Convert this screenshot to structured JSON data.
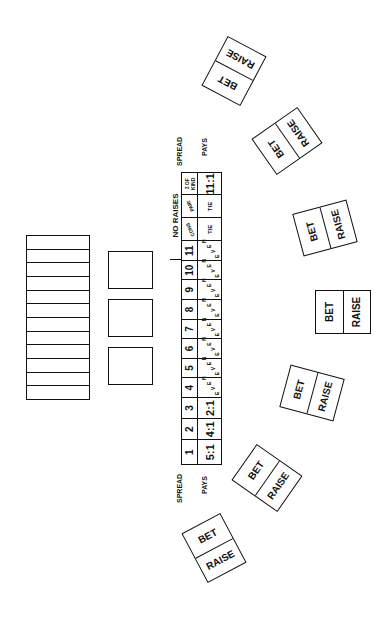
{
  "rack": {
    "slots": 12
  },
  "card_boxes": [
    {
      "id": 1
    },
    {
      "id": 2
    },
    {
      "id": 3
    }
  ],
  "payout_table": {
    "row_labels": {
      "spread": "SPREAD",
      "pays": "PAYS"
    },
    "header": "NO RAISES",
    "columns": [
      {
        "spread": "1",
        "pays": "5:1"
      },
      {
        "spread": "2",
        "pays": "4:1"
      },
      {
        "spread": "3",
        "pays": "2:1"
      },
      {
        "spread": "4",
        "pays": "EVEN"
      },
      {
        "spread": "5",
        "pays": "EVEN"
      },
      {
        "spread": "6",
        "pays": "EVEN"
      },
      {
        "spread": "7",
        "pays": "EVEN"
      },
      {
        "spread": "8",
        "pays": "EVEN"
      },
      {
        "spread": "9",
        "pays": "EVEN"
      },
      {
        "spread": "10",
        "pays": "EVEN"
      },
      {
        "spread": "11",
        "pays": "EVEN"
      },
      {
        "spread": "CONS",
        "pays": "TIE"
      },
      {
        "spread": "PAIR",
        "pays": "TIE"
      },
      {
        "spread": "3 OF KIND",
        "pays": "11:1"
      }
    ]
  },
  "bet_spots": [
    {
      "bet": "BET",
      "raise": "RAISE"
    },
    {
      "bet": "BET",
      "raise": "RAISE"
    },
    {
      "bet": "BET",
      "raise": "RAISE"
    },
    {
      "bet": "BET",
      "raise": "RAISE"
    },
    {
      "bet": "BET",
      "raise": "RAISE"
    },
    {
      "bet": "BET",
      "raise": "RAISE"
    },
    {
      "bet": "BET",
      "raise": "RAISE"
    }
  ],
  "colors": {
    "ink": "#111111",
    "background": "#ffffff"
  }
}
